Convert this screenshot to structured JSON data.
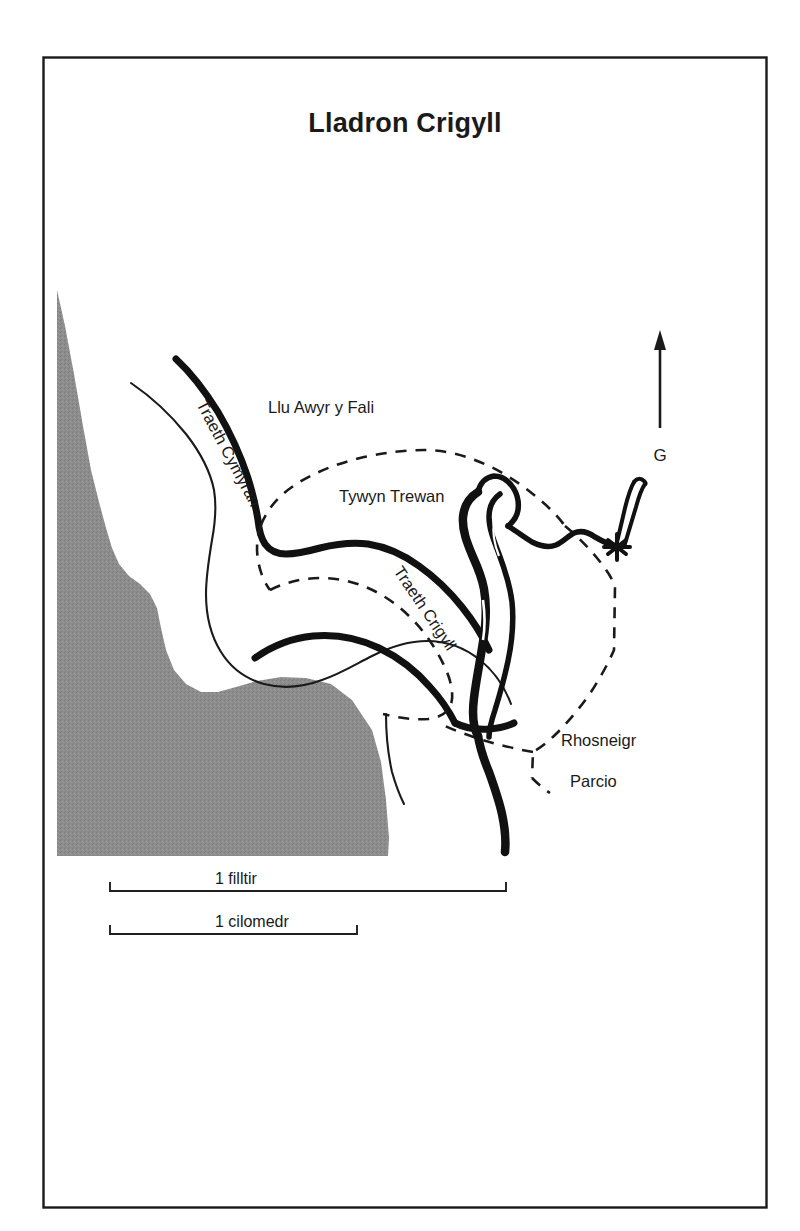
{
  "figure": {
    "title": "Lladron Crigyll",
    "type": "line-drawing map",
    "frame": {
      "stroke_color": "#1a1a1a"
    },
    "background_color": "#ffffff"
  },
  "map": {
    "landmass": {
      "name": "shaded-land-area",
      "fill_color": "#8a8a8a",
      "description": "textured grey land mass occupying the lower-left of the map"
    },
    "labels": [
      {
        "id": "traeth-cymyran",
        "text": "Traeth Cymyran",
        "rotation": 62,
        "x": 196,
        "y": 404
      },
      {
        "id": "llu-awyr-y-fali",
        "text": "Llu Awyr y Fali",
        "rotation": 0,
        "x": 268,
        "y": 413
      },
      {
        "id": "tywyn-trewan",
        "text": "Tywyn Trewan",
        "rotation": 0,
        "x": 339,
        "y": 502
      },
      {
        "id": "traeth-crigyll",
        "text": "Traeth Crigyll",
        "rotation": 56,
        "x": 393,
        "y": 571
      },
      {
        "id": "rhosneigr",
        "text": "Rhosneigr",
        "rotation": 0,
        "x": 561,
        "y": 746
      },
      {
        "id": "parcio",
        "text": "Parcio",
        "rotation": 0,
        "x": 570,
        "y": 787
      }
    ],
    "north_arrow": {
      "label": "G",
      "direction": "up",
      "x": 660,
      "y": 455
    },
    "scale_bars": [
      {
        "id": "mile-scale",
        "label": "1 filltir",
        "x_start": 110,
        "x_end": 506,
        "y": 891
      },
      {
        "id": "kilometre-scale",
        "label": "1 cilomedr",
        "x_start": 110,
        "x_end": 357,
        "y": 934
      }
    ],
    "legend_keys": [
      {
        "id": "thick-black-line",
        "meaning": "coastline / beach edge"
      },
      {
        "id": "dashed-line",
        "meaning": "boundary"
      },
      {
        "id": "grey-fill",
        "meaning": "land"
      }
    ]
  }
}
